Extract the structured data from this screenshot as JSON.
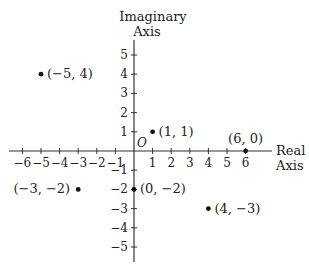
{
  "chart_data": {
    "type": "scatter",
    "title": "",
    "xlabel": "Real Axis",
    "ylabel": "Imaginary Axis",
    "xlim": [
      -6,
      6
    ],
    "ylim": [
      -5,
      5
    ],
    "x_ticks": [
      -6,
      -5,
      -4,
      -3,
      -2,
      -1,
      1,
      2,
      3,
      4,
      5,
      6
    ],
    "y_ticks": [
      5,
      4,
      3,
      2,
      1,
      -1,
      -2,
      -3,
      -4,
      -5
    ],
    "origin_label": "O",
    "grid": false,
    "points": [
      {
        "x": -5,
        "y": 4,
        "label": "(−5, 4)"
      },
      {
        "x": 1,
        "y": 1,
        "label": "(1, 1)"
      },
      {
        "x": 6,
        "y": 0,
        "label": "(6, 0)"
      },
      {
        "x": -3,
        "y": -2,
        "label": "(−3, −2)"
      },
      {
        "x": 0,
        "y": -2,
        "label": "(0, −2)"
      },
      {
        "x": 4,
        "y": -3,
        "label": "(4, −3)"
      }
    ]
  },
  "labels": {
    "y_axis_line1": "Imaginary",
    "y_axis_line2": "Axis",
    "x_axis_line1": "Real",
    "x_axis_line2": "Axis",
    "origin": "O"
  },
  "colors": {
    "ink": "#222222",
    "background": "#ffffff"
  }
}
